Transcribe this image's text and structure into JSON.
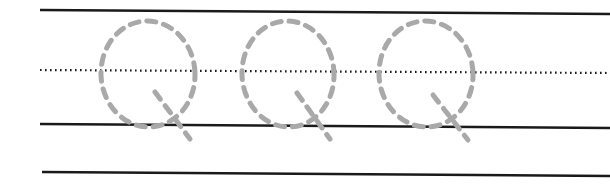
{
  "worksheet": {
    "type": "handwriting-practice",
    "letter": "Q",
    "letter_count": 3,
    "colors": {
      "ruling_line": "#1a1a1a",
      "trace_stroke": "#a9a9a9",
      "background": "#ffffff"
    },
    "lines": {
      "top": "solid",
      "midline": "dotted",
      "baseline": "solid",
      "descender": "solid"
    },
    "letters": [
      {
        "char": "Q",
        "cx": 148,
        "cy": 74
      },
      {
        "char": "Q",
        "cx": 288,
        "cy": 74
      },
      {
        "char": "Q",
        "cx": 426,
        "cy": 74
      }
    ]
  }
}
